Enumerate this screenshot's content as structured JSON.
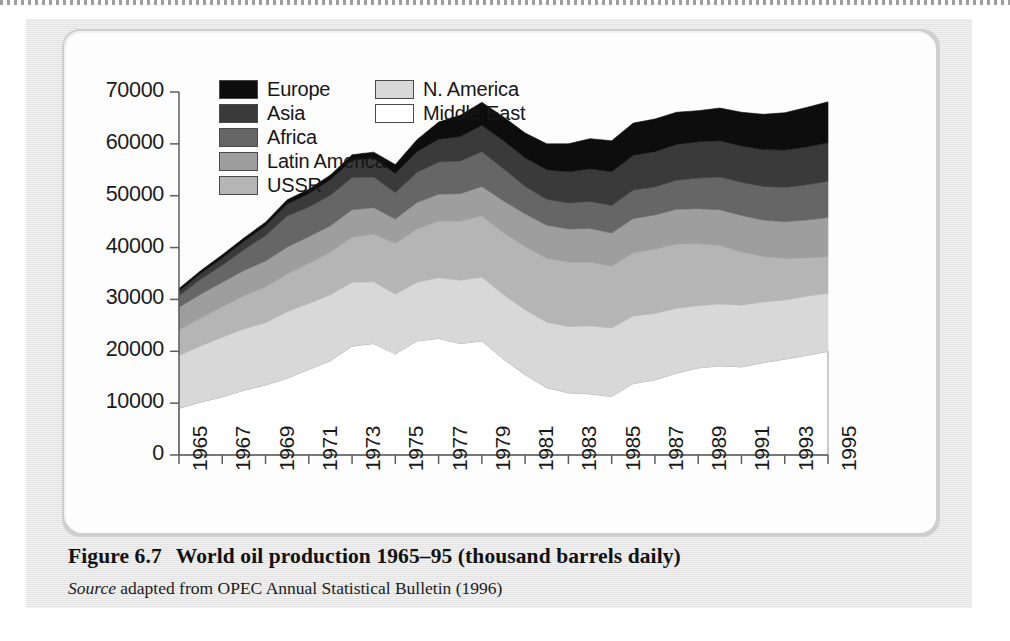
{
  "figure": {
    "caption_number": "Figure 6.7",
    "caption_title": "World oil production 1965–95 (thousand barrels daily)",
    "source_label": "Source",
    "source_text": "adapted from OPEC Annual Statistical Bulletin (1996)"
  },
  "legend": {
    "left_column": [
      {
        "label": "Europe",
        "color": "#0d0d0d"
      },
      {
        "label": "Asia",
        "color": "#3a3a3a"
      },
      {
        "label": "Africa",
        "color": "#666666"
      },
      {
        "label": "Latin America",
        "color": "#9e9e9e"
      },
      {
        "label": "USSR",
        "color": "#b5b5b5"
      }
    ],
    "right_column": [
      {
        "label": "N. America",
        "color": "#d8d8d8"
      },
      {
        "label": "Middle East",
        "color": "#ffffff"
      }
    ]
  },
  "axes": {
    "y_ticks": [
      "70000",
      "60000",
      "50000",
      "40000",
      "30000",
      "20000",
      "10000",
      "0"
    ],
    "y_min": 0,
    "y_max": 70000,
    "x_ticks": [
      "1965",
      "1967",
      "1969",
      "1971",
      "1973",
      "1975",
      "1977",
      "1979",
      "1981",
      "1983",
      "1985",
      "1987",
      "1989",
      "1991",
      "1993",
      "1995"
    ]
  },
  "chart_data": {
    "type": "area",
    "stacked": true,
    "title": "World oil production 1965–95 (thousand barrels daily)",
    "xlabel": "",
    "ylabel": "",
    "ylim": [
      0,
      70000
    ],
    "xlim": [
      1965,
      1995
    ],
    "grid": false,
    "legend_position": "top-inside",
    "units": "thousand barrels daily",
    "x": [
      1965,
      1966,
      1967,
      1968,
      1969,
      1970,
      1971,
      1972,
      1973,
      1974,
      1975,
      1976,
      1977,
      1978,
      1979,
      1980,
      1981,
      1982,
      1983,
      1984,
      1985,
      1986,
      1987,
      1988,
      1989,
      1990,
      1991,
      1992,
      1993,
      1994,
      1995
    ],
    "stack_order_bottom_to_top": [
      "Middle East",
      "N. America",
      "USSR",
      "Latin America",
      "Africa",
      "Asia",
      "Europe"
    ],
    "series": [
      {
        "name": "Middle East",
        "color": "#ffffff",
        "values": [
          9000,
          10200,
          11200,
          12500,
          13500,
          14800,
          16500,
          18200,
          21000,
          21500,
          19500,
          22000,
          22500,
          21500,
          22000,
          18500,
          15500,
          13000,
          12000,
          11800,
          11300,
          13800,
          14500,
          15800,
          16800,
          17200,
          17000,
          17800,
          18500,
          19200,
          20000
        ]
      },
      {
        "name": "N. America",
        "color": "#d8d8d8",
        "values": [
          10200,
          10800,
          11500,
          11800,
          12000,
          12800,
          12700,
          12700,
          12300,
          11900,
          11500,
          11300,
          11700,
          12200,
          12300,
          12400,
          12500,
          12600,
          12800,
          13100,
          13200,
          13000,
          12800,
          12500,
          12000,
          11900,
          11900,
          11700,
          11400,
          11400,
          11200
        ]
      },
      {
        "name": "USSR",
        "color": "#b5b5b5",
        "values": [
          4900,
          5400,
          5900,
          6400,
          6900,
          7300,
          7800,
          8200,
          8700,
          9200,
          9800,
          10300,
          10900,
          11400,
          11800,
          12000,
          12200,
          12300,
          12400,
          12300,
          11900,
          12200,
          12400,
          12400,
          12000,
          11300,
          10300,
          8800,
          8000,
          7400,
          7100
        ]
      },
      {
        "name": "Latin America",
        "color": "#9e9e9e",
        "values": [
          4400,
          4600,
          4700,
          4900,
          5000,
          5200,
          5100,
          5100,
          5300,
          5100,
          4700,
          5100,
          5200,
          5300,
          5700,
          6100,
          6300,
          6400,
          6400,
          6500,
          6400,
          6600,
          6600,
          6700,
          6700,
          6900,
          7000,
          7000,
          7100,
          7300,
          7500
        ]
      },
      {
        "name": "Africa",
        "color": "#666666",
        "values": [
          2200,
          2900,
          3300,
          4000,
          4900,
          6000,
          5700,
          5900,
          6200,
          5900,
          5100,
          5800,
          6200,
          6300,
          6700,
          6200,
          5300,
          5000,
          5000,
          5200,
          5300,
          5500,
          5400,
          5600,
          5900,
          6300,
          6400,
          6500,
          6600,
          6800,
          7000
        ]
      },
      {
        "name": "Asia",
        "color": "#3a3a3a",
        "values": [
          900,
          1100,
          1400,
          1600,
          1900,
          2300,
          2600,
          3000,
          3400,
          3600,
          3700,
          4000,
          4400,
          4700,
          5100,
          5400,
          5500,
          5700,
          6000,
          6300,
          6500,
          6700,
          6800,
          6900,
          7000,
          7000,
          7000,
          7100,
          7200,
          7300,
          7400
        ]
      },
      {
        "name": "Europe",
        "color": "#0d0d0d",
        "values": [
          500,
          550,
          600,
          650,
          700,
          800,
          850,
          900,
          1000,
          1200,
          1700,
          2300,
          3300,
          4100,
          4400,
          4600,
          4800,
          5000,
          5400,
          5800,
          6000,
          6200,
          6300,
          6200,
          6000,
          6300,
          6500,
          6800,
          7200,
          7600,
          7900
        ]
      }
    ],
    "totals": [
      32100,
      35550,
      38600,
      41850,
      44900,
      49200,
      51300,
      54000,
      57900,
      58400,
      56000,
      60800,
      64200,
      65500,
      68000,
      65200,
      62100,
      62000,
      60400,
      61000,
      60600,
      64000,
      64800,
      66100,
      66400,
      66900,
      67100,
      66700,
      66000,
      66000,
      68100
    ]
  }
}
